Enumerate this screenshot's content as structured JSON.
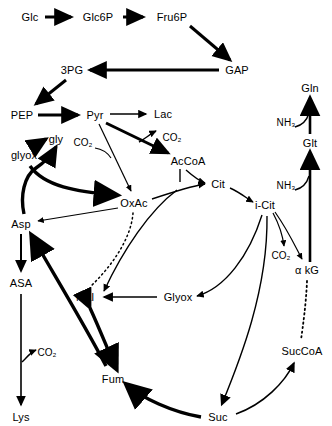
{
  "diagram": {
    "background": "#ffffff",
    "stroke_color": "#000000",
    "nodes": [
      {
        "id": "glc",
        "label": "Glc",
        "x": 30,
        "y": 17
      },
      {
        "id": "glc6p",
        "label": "Glc6P",
        "x": 98,
        "y": 17
      },
      {
        "id": "fru6p",
        "label": "Fru6P",
        "x": 172,
        "y": 17
      },
      {
        "id": "gap",
        "label": "GAP",
        "x": 237,
        "y": 70
      },
      {
        "id": "pg3",
        "label": "3PG",
        "x": 72,
        "y": 70
      },
      {
        "id": "pep",
        "label": "PEP",
        "x": 22,
        "y": 115
      },
      {
        "id": "pyr",
        "label": "Pyr",
        "x": 95,
        "y": 115
      },
      {
        "id": "lac",
        "label": "Lac",
        "x": 163,
        "y": 114
      },
      {
        "id": "gly",
        "label": "gly",
        "x": 56,
        "y": 139
      },
      {
        "id": "glyox_l",
        "label": "glyox",
        "x": 24,
        "y": 155
      },
      {
        "id": "co2_pyr",
        "label": "CO₂",
        "x": 83,
        "y": 143,
        "sub": true
      },
      {
        "id": "co2_acc",
        "label": "CO₂",
        "x": 172,
        "y": 138,
        "sub": true
      },
      {
        "id": "accoa",
        "label": "AcCoA",
        "x": 188,
        "y": 161
      },
      {
        "id": "oxac",
        "label": "OxAc",
        "x": 134,
        "y": 203
      },
      {
        "id": "cit",
        "label": "Cit",
        "x": 218,
        "y": 184
      },
      {
        "id": "icit",
        "label": "i-Cit",
        "x": 265,
        "y": 205
      },
      {
        "id": "asp",
        "label": "Asp",
        "x": 21,
        "y": 224
      },
      {
        "id": "asa",
        "label": "ASA",
        "x": 21,
        "y": 283
      },
      {
        "id": "lys",
        "label": "Lys",
        "x": 21,
        "y": 417
      },
      {
        "id": "co2_asa",
        "label": "CO₂",
        "x": 47,
        "y": 353,
        "sub": true
      },
      {
        "id": "mal",
        "label": "Mal",
        "x": 85,
        "y": 297
      },
      {
        "id": "glyox_c",
        "label": "Glyox",
        "x": 178,
        "y": 297
      },
      {
        "id": "fum",
        "label": "Fum",
        "x": 113,
        "y": 379
      },
      {
        "id": "suc",
        "label": "Suc",
        "x": 218,
        "y": 417
      },
      {
        "id": "succoa",
        "label": "SucCoA",
        "x": 302,
        "y": 351
      },
      {
        "id": "akg",
        "label": "α kG",
        "x": 307,
        "y": 270
      },
      {
        "id": "co2_icit",
        "label": "CO₂",
        "x": 281,
        "y": 256,
        "sub": true
      },
      {
        "id": "glt",
        "label": "Glt",
        "x": 310,
        "y": 143
      },
      {
        "id": "gln",
        "label": "Gln",
        "x": 310,
        "y": 88
      },
      {
        "id": "nh3_glt",
        "label": "NH₃",
        "x": 286,
        "y": 123,
        "sub": true
      },
      {
        "id": "nh3_akg",
        "label": "NH₃",
        "x": 286,
        "y": 186,
        "sub": true
      }
    ],
    "edges": [
      {
        "from": "glc",
        "to": "glc6p",
        "style": "thick"
      },
      {
        "from": "glc6p",
        "to": "fru6p",
        "style": "thick"
      },
      {
        "from": "fru6p",
        "to": "gap",
        "style": "thick"
      },
      {
        "from": "gap",
        "to": "pg3",
        "style": "thick"
      },
      {
        "from": "pg3",
        "to": "pep",
        "style": "thick"
      },
      {
        "from": "pep",
        "to": "pyr",
        "style": "thick"
      },
      {
        "from": "pyr",
        "to": "lac",
        "style": "thin"
      },
      {
        "from": "pyr",
        "to": "accoa",
        "style": "thick",
        "byproduct": "CO₂"
      },
      {
        "from": "pyr",
        "to": "oxac",
        "style": "thin",
        "byproduct": "CO₂"
      },
      {
        "from": "glyox_l",
        "to": "gly",
        "style": "thick"
      },
      {
        "from": "asp",
        "to": "gly",
        "style": "thick"
      },
      {
        "from": "asp",
        "to": "oxac",
        "style": "thick"
      },
      {
        "from": "oxac",
        "to": "asp",
        "style": "thin"
      },
      {
        "from": "oxac",
        "to": "cit",
        "style": "thin"
      },
      {
        "from": "accoa",
        "to": "cit",
        "style": "thin"
      },
      {
        "from": "cit",
        "to": "icit",
        "style": "thin"
      },
      {
        "from": "icit",
        "to": "akg",
        "style": "thin",
        "byproduct": "CO₂"
      },
      {
        "from": "icit",
        "to": "glyox_c",
        "style": "thin"
      },
      {
        "from": "icit",
        "to": "suc",
        "style": "thin"
      },
      {
        "from": "accoa",
        "to": "mal",
        "style": "thin"
      },
      {
        "from": "glyox_c",
        "to": "mal",
        "style": "thin"
      },
      {
        "from": "oxac",
        "to": "mal",
        "style": "dotted"
      },
      {
        "from": "mal",
        "to": "fum",
        "style": "thick-double"
      },
      {
        "from": "fum",
        "to": "asp",
        "style": "thick"
      },
      {
        "from": "asp",
        "to": "asa",
        "style": "thin"
      },
      {
        "from": "asa",
        "to": "lys",
        "style": "thin",
        "byproduct": "CO₂"
      },
      {
        "from": "suc",
        "to": "fum",
        "style": "thick"
      },
      {
        "from": "suc",
        "to": "succoa",
        "style": "thin"
      },
      {
        "from": "akg",
        "to": "succoa",
        "style": "dotted"
      },
      {
        "from": "akg",
        "to": "glt",
        "style": "thick",
        "cofactor": "NH₃"
      },
      {
        "from": "glt",
        "to": "gln",
        "style": "thick",
        "cofactor": "NH₃"
      }
    ]
  }
}
